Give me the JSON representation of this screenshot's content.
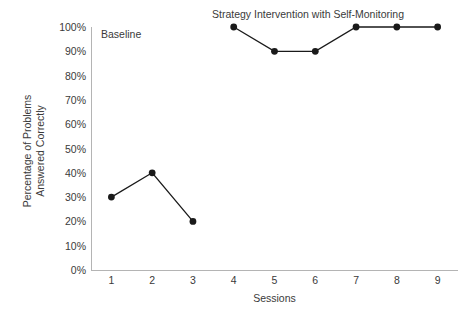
{
  "chart_data": {
    "type": "line",
    "title": "",
    "xlabel": "Sessions",
    "ylabel": "Percentage of Problems Answered Correctly",
    "ylabel_lines": [
      "Percentage of Problems",
      "Answered Correctly"
    ],
    "x": [
      1,
      2,
      3,
      4,
      5,
      6,
      7,
      8,
      9
    ],
    "xtick_labels": [
      "1",
      "2",
      "3",
      "4",
      "5",
      "6",
      "7",
      "8",
      "9"
    ],
    "ytick_labels": [
      "0%",
      "10%",
      "20%",
      "30%",
      "40%",
      "50%",
      "60%",
      "70%",
      "80%",
      "90%",
      "100%"
    ],
    "ytick_values": [
      0,
      10,
      20,
      30,
      40,
      50,
      60,
      70,
      80,
      90,
      100
    ],
    "ylim": [
      0,
      100
    ],
    "xlim": [
      0.5,
      9.5
    ],
    "grid": false,
    "legend": "none",
    "marker": "filled-circle",
    "line_color": "#1a1a1a",
    "marker_color": "#1a1a1a",
    "axis_color": "#b4b4b4",
    "background_color": "#ffffff",
    "series": [
      {
        "name": "Baseline",
        "x": [
          1,
          2,
          3
        ],
        "values": [
          30,
          40,
          20
        ]
      },
      {
        "name": "Strategy Intervention with Self-Monitoring",
        "x": [
          4,
          5,
          6,
          7,
          8,
          9
        ],
        "values": [
          100,
          90,
          90,
          100,
          100,
          100
        ]
      }
    ],
    "annotations": [
      {
        "name": "baseline-phase-label",
        "text": "Baseline"
      },
      {
        "name": "intervention-phase-label",
        "text": "Strategy Intervention with Self-Monitoring"
      }
    ]
  }
}
